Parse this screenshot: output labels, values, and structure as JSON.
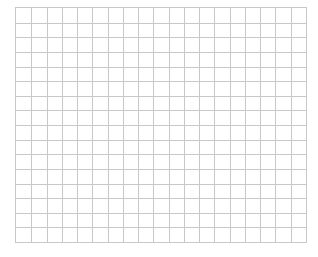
{
  "grid": {
    "columns": 19,
    "rows": 16,
    "line_color": "#c8c8c8",
    "background_color": "#ffffff"
  }
}
